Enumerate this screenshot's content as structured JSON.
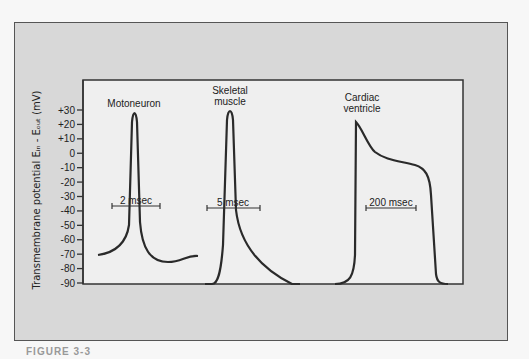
{
  "figure": {
    "caption": "FIGURE 3-3"
  },
  "chart_data": {
    "type": "line",
    "title": "",
    "ylabel": "Transmembrane potential Eᵢₙ - Eₒᵤₜ (mV)",
    "xlabel": "",
    "ylim": [
      -90,
      30
    ],
    "yticks": [
      "+30",
      "+20",
      "+10",
      "0",
      "-10",
      "-20",
      "-30",
      "-40",
      "-50",
      "-60",
      "-70",
      "-80",
      "-90"
    ],
    "grid": false,
    "series": [
      {
        "name": "Motoneuron",
        "label_lines": [
          "Motoneuron"
        ],
        "scale_bar": "2 msec",
        "resting_mV": -70,
        "peak_mV": 27,
        "shape": "brief spike with after-hyperpolarization to about -73 mV"
      },
      {
        "name": "Skeletal muscle",
        "label_lines": [
          "Skeletal",
          "muscle"
        ],
        "scale_bar": "5 msec",
        "resting_mV": -90,
        "peak_mV": 28,
        "shape": "spike with slow decay back to -90 mV"
      },
      {
        "name": "Cardiac ventricle",
        "label_lines": [
          "Cardiac",
          "ventricle"
        ],
        "scale_bar": "200 msec",
        "resting_mV": -90,
        "peak_mV": 20,
        "plateau_mV": -5,
        "shape": "rapid upstroke, early repolarization, long plateau, repolarization to -90 mV"
      }
    ]
  }
}
